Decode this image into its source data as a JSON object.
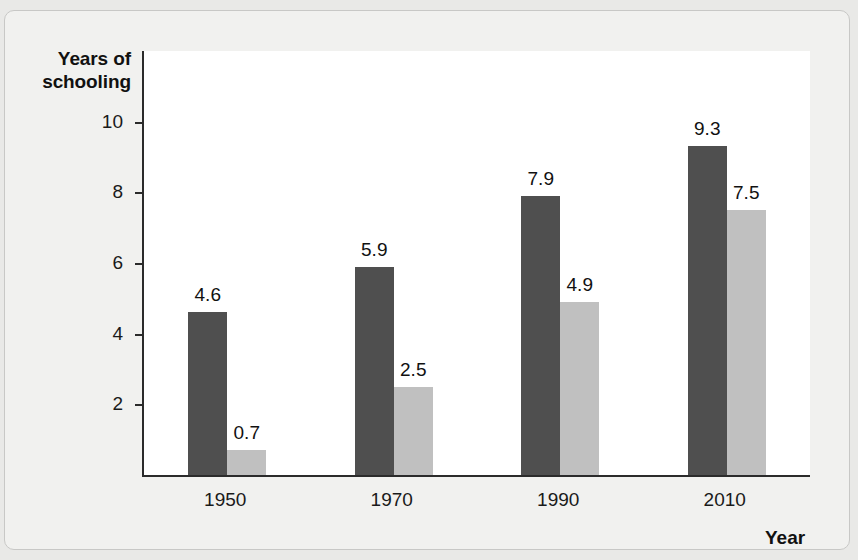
{
  "axes": {
    "y_title": "Years of\nschooling",
    "y_title_line1": "Years of",
    "y_title_line2": "schooling",
    "x_title": "Year"
  },
  "legend": {
    "items": [
      {
        "label": "Argentina",
        "color": "#4f4f4f"
      },
      {
        "label": "China",
        "color": "#c0c0c0"
      }
    ]
  },
  "colors": {
    "argentina": "#4f4f4f",
    "china": "#c0c0c0",
    "axis": "#2b2b2b",
    "plot_background": "#ffffff",
    "page_background": "#f1f1ef",
    "text": "#111111"
  },
  "chart_data": {
    "type": "bar",
    "title": "",
    "xlabel": "Year",
    "ylabel": "Years of schooling",
    "categories": [
      "1950",
      "1970",
      "1990",
      "2010"
    ],
    "series": [
      {
        "name": "Argentina",
        "color": "#4f4f4f",
        "values": [
          4.6,
          5.9,
          7.9,
          9.3
        ]
      },
      {
        "name": "China",
        "color": "#c0c0c0",
        "values": [
          0.7,
          2.5,
          4.9,
          7.5
        ]
      }
    ],
    "value_labels": {
      "Argentina": [
        "4.6",
        "5.9",
        "7.9",
        "9.3"
      ],
      "China": [
        "0.7",
        "2.5",
        "4.9",
        "7.5"
      ]
    },
    "ylim": [
      0,
      12
    ],
    "yticks": [
      2,
      4,
      6,
      8,
      10
    ],
    "ytick_labels": [
      "2",
      "4",
      "6",
      "8",
      "10"
    ],
    "grid": false,
    "legend_position": "top-right"
  }
}
